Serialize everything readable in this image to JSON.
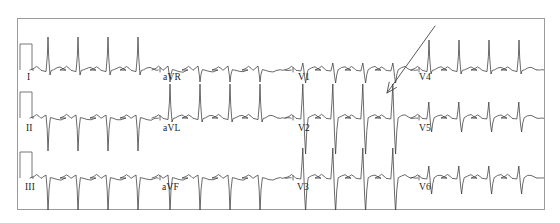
{
  "figure": {
    "kind": "12-lead-electrocardiogram",
    "width": 560,
    "height": 223,
    "background_color": "#ffffff",
    "frame": {
      "x": 17,
      "y": 18,
      "width": 528,
      "height": 192,
      "stroke_color": "#9a9a9a"
    }
  },
  "traces": {
    "stroke_color": "#3a3a3a",
    "calibration_stroke_color": "#6a6a6a"
  },
  "annotation": {
    "type": "arrow",
    "name": "pointer-arrow",
    "color": "#474747",
    "tail_x": 435,
    "tail_y": 26,
    "tip_x": 387,
    "tip_y": 93
  },
  "rows": [
    {
      "name": "row-limb-leads-I",
      "baseline": 70,
      "calibration_pulse": true,
      "leads": [
        {
          "label": "I",
          "label_x": 27,
          "label_y": 80,
          "segment_x0": 32,
          "segment_x1": 160
        },
        {
          "label": "aVR",
          "label_x": 163,
          "label_y": 80,
          "segment_x0": 160,
          "segment_x1": 293
        },
        {
          "label": "V1",
          "label_x": 298,
          "label_y": 80,
          "segment_x0": 293,
          "segment_x1": 419
        },
        {
          "label": "V4",
          "label_x": 419,
          "label_y": 80,
          "segment_x0": 419,
          "segment_x1": 545
        }
      ]
    },
    {
      "name": "row-limb-leads-II",
      "baseline": 118,
      "calibration_pulse": true,
      "leads": [
        {
          "label": "II",
          "label_x": 26,
          "label_y": 131,
          "segment_x0": 32,
          "segment_x1": 160
        },
        {
          "label": "aVL",
          "label_x": 163,
          "label_y": 131,
          "segment_x0": 160,
          "segment_x1": 293
        },
        {
          "label": "V2",
          "label_x": 298,
          "label_y": 131,
          "segment_x0": 293,
          "segment_x1": 419
        },
        {
          "label": "V5",
          "label_x": 419,
          "label_y": 131,
          "segment_x0": 419,
          "segment_x1": 545
        }
      ]
    },
    {
      "name": "row-limb-leads-III",
      "baseline": 178,
      "calibration_pulse": true,
      "leads": [
        {
          "label": "III",
          "label_x": 25,
          "label_y": 190,
          "segment_x0": 32,
          "segment_x1": 160
        },
        {
          "label": "aVF",
          "label_x": 162,
          "label_y": 190,
          "segment_x0": 160,
          "segment_x1": 293
        },
        {
          "label": "V3",
          "label_x": 297,
          "label_y": 190,
          "segment_x0": 293,
          "segment_x1": 419
        },
        {
          "label": "V6",
          "label_x": 419,
          "label_y": 190,
          "segment_x0": 419,
          "segment_x1": 545
        }
      ]
    }
  ],
  "chart_data": {
    "type": "line",
    "title": "",
    "xlabel": "",
    "ylabel": "",
    "rhythm": {
      "regularity": "regular",
      "approx_beats_per_segment": 4
    },
    "series": [
      {
        "name": "I",
        "row": 0,
        "column": 0,
        "morphology": "tall narrow upright R waves",
        "r_amplitude_px": 33,
        "s_amplitude_px": 5,
        "beat_spacing_px": 30,
        "beat_count": 4,
        "polarity": "positive"
      },
      {
        "name": "aVR",
        "row": 0,
        "column": 1,
        "morphology": "small negative QRS with shallow S",
        "r_amplitude_px": 4,
        "s_amplitude_px": 12,
        "beat_spacing_px": 30,
        "beat_count": 4,
        "polarity": "negative"
      },
      {
        "name": "V1",
        "row": 0,
        "column": 2,
        "morphology": "small rS complexes with notched P",
        "r_amplitude_px": 7,
        "s_amplitude_px": 13,
        "beat_spacing_px": 30,
        "beat_count": 4,
        "polarity": "biphasic"
      },
      {
        "name": "V4",
        "row": 0,
        "column": 3,
        "morphology": "tall upright R waves",
        "r_amplitude_px": 30,
        "s_amplitude_px": 4,
        "beat_spacing_px": 30,
        "beat_count": 4,
        "polarity": "positive"
      },
      {
        "name": "II",
        "row": 1,
        "column": 0,
        "morphology": "deep negative QS complexes",
        "r_amplitude_px": 3,
        "s_amplitude_px": 33,
        "beat_spacing_px": 30,
        "beat_count": 4,
        "polarity": "negative"
      },
      {
        "name": "aVL",
        "row": 1,
        "column": 1,
        "morphology": "tall upright R waves",
        "r_amplitude_px": 34,
        "s_amplitude_px": 4,
        "beat_spacing_px": 30,
        "beat_count": 4,
        "polarity": "positive"
      },
      {
        "name": "V2",
        "row": 1,
        "column": 2,
        "morphology": "tall R with deep S, large amplitude",
        "r_amplitude_px": 34,
        "s_amplitude_px": 36,
        "beat_spacing_px": 30,
        "beat_count": 4,
        "polarity": "biphasic"
      },
      {
        "name": "V5",
        "row": 1,
        "column": 3,
        "morphology": "modest R with S wave",
        "r_amplitude_px": 16,
        "s_amplitude_px": 14,
        "beat_spacing_px": 30,
        "beat_count": 4,
        "polarity": "biphasic"
      },
      {
        "name": "III",
        "row": 2,
        "column": 0,
        "morphology": "deep negative QS complexes clipped at frame",
        "r_amplitude_px": 3,
        "s_amplitude_px": 34,
        "beat_spacing_px": 30,
        "beat_count": 4,
        "polarity": "negative"
      },
      {
        "name": "aVF",
        "row": 2,
        "column": 1,
        "morphology": "deep negative QS complexes clipped at frame",
        "r_amplitude_px": 3,
        "s_amplitude_px": 34,
        "beat_spacing_px": 30,
        "beat_count": 4,
        "polarity": "negative"
      },
      {
        "name": "V3",
        "row": 2,
        "column": 2,
        "morphology": "tall R with very deep S",
        "r_amplitude_px": 30,
        "s_amplitude_px": 34,
        "beat_spacing_px": 30,
        "beat_count": 4,
        "polarity": "biphasic"
      },
      {
        "name": "V6",
        "row": 2,
        "column": 3,
        "morphology": "small R with moderate S",
        "r_amplitude_px": 12,
        "s_amplitude_px": 16,
        "beat_spacing_px": 30,
        "beat_count": 4,
        "polarity": "biphasic"
      }
    ]
  }
}
